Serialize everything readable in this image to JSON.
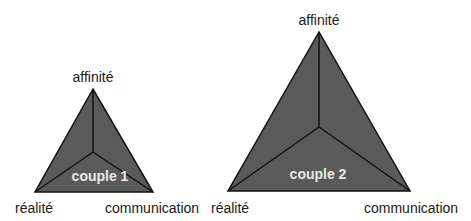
{
  "colors": {
    "triangle_fill": "#5a5a5a",
    "stroke": "#111111",
    "couple_label": "#e8e8e8",
    "label_text": "#1a1a1a"
  },
  "diagrams": [
    {
      "couple_label": "couple 1",
      "vertices": {
        "top": "affinité",
        "bottom_left": "réalité",
        "bottom_right": "communication"
      }
    },
    {
      "couple_label": "couple 2",
      "vertices": {
        "top": "affinité",
        "bottom_left": "réalité",
        "bottom_right": "communication"
      }
    }
  ]
}
